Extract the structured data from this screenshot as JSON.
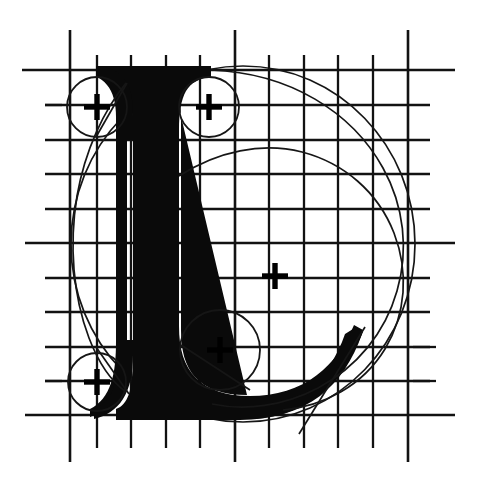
{
  "document": {
    "title": "Letterform Construction Diagram",
    "subject": "Capital letter L",
    "style": "Serif / Roman capital",
    "technique": "Geometric grid construction with circle guides",
    "background_color": "#ffffff",
    "ink_color": "#0a0a0a",
    "guide_color": "#161616",
    "width": 479,
    "height": 479
  },
  "canvas": {
    "width": 479,
    "height": 479
  },
  "grid": {
    "label": "construction-grid",
    "spacing": 34.5,
    "color": "#121212",
    "origin_x": 62,
    "origin_y": 70,
    "vertical_lines": [
      {
        "x": 70,
        "y1": 30,
        "y2": 462,
        "weight": "major"
      },
      {
        "x": 97,
        "y1": 55,
        "y2": 448,
        "weight": "minor"
      },
      {
        "x": 131,
        "y1": 55,
        "y2": 448,
        "weight": "minor"
      },
      {
        "x": 166,
        "y1": 55,
        "y2": 448,
        "weight": "minor"
      },
      {
        "x": 200,
        "y1": 55,
        "y2": 448,
        "weight": "minor"
      },
      {
        "x": 235,
        "y1": 30,
        "y2": 462,
        "weight": "major"
      },
      {
        "x": 269,
        "y1": 55,
        "y2": 448,
        "weight": "minor"
      },
      {
        "x": 304,
        "y1": 55,
        "y2": 448,
        "weight": "minor"
      },
      {
        "x": 338,
        "y1": 55,
        "y2": 448,
        "weight": "minor"
      },
      {
        "x": 373,
        "y1": 55,
        "y2": 448,
        "weight": "minor"
      },
      {
        "x": 408,
        "y1": 30,
        "y2": 462,
        "weight": "major"
      }
    ],
    "horizontal_lines": [
      {
        "y": 70,
        "x1": 22,
        "x2": 455,
        "weight": "major"
      },
      {
        "y": 105,
        "x1": 45,
        "x2": 430,
        "weight": "minor"
      },
      {
        "y": 140,
        "x1": 45,
        "x2": 430,
        "weight": "minor"
      },
      {
        "y": 174,
        "x1": 45,
        "x2": 430,
        "weight": "minor"
      },
      {
        "y": 209,
        "x1": 45,
        "x2": 430,
        "weight": "minor"
      },
      {
        "y": 243,
        "x1": 25,
        "x2": 455,
        "weight": "major"
      },
      {
        "y": 278,
        "x1": 45,
        "x2": 430,
        "weight": "minor"
      },
      {
        "y": 312,
        "x1": 45,
        "x2": 430,
        "weight": "minor"
      },
      {
        "y": 347,
        "x1": 45,
        "x2": 430,
        "weight": "minor"
      },
      {
        "y": 381,
        "x1": 45,
        "x2": 430,
        "weight": "minor"
      },
      {
        "y": 415,
        "x1": 25,
        "x2": 455,
        "weight": "major"
      }
    ],
    "edge_ticks": [
      {
        "x1": 45,
        "y1": 105,
        "x2": 62,
        "y2": 105
      },
      {
        "x1": 45,
        "y1": 381,
        "x2": 62,
        "y2": 381
      },
      {
        "x1": 413,
        "y1": 381,
        "x2": 436,
        "y2": 381
      },
      {
        "x1": 413,
        "y1": 347,
        "x2": 436,
        "y2": 347
      }
    ]
  },
  "glyph": {
    "letter": "L",
    "name": "capital-letter-l",
    "cap_height_top_y": 70,
    "baseline_y": 415,
    "stem_left_x": 128,
    "stem_right_x": 170,
    "serif_top_left_x": 96,
    "serif_top_right_x": 211,
    "bowl_right_x": 375,
    "description": "Serif capital L with rounded terminals, curved bowl sweeping right and a diagonal tail at the lower right"
  },
  "construction": {
    "small_circles": [
      {
        "name": "circle-top-left",
        "cx": 97,
        "cy": 107,
        "r": 30,
        "cross": true
      },
      {
        "name": "circle-top-right",
        "cx": 209,
        "cy": 107,
        "r": 30,
        "cross": true
      },
      {
        "name": "circle-bottom-left",
        "cx": 97,
        "cy": 382,
        "r": 29,
        "cross": true
      },
      {
        "name": "circle-lower-middle",
        "cx": 220,
        "cy": 350,
        "r": 40,
        "cross": true
      }
    ],
    "center_mark": {
      "name": "center-crosshair",
      "cx": 275,
      "cy": 276
    },
    "large_circle": {
      "name": "outer-construction-circle",
      "cx": 243,
      "cy": 244,
      "rx": 172,
      "ry": 178
    },
    "crosshair_arm": 13,
    "crosshair_thickness": 5.4
  },
  "legend": {
    "items": [
      {
        "key": "grid",
        "label": "Construction grid"
      },
      {
        "key": "small-circles",
        "label": "Terminal radius circles"
      },
      {
        "key": "large-circle",
        "label": "Outer proportion circle"
      },
      {
        "key": "crosshair",
        "label": "Circle centre mark"
      },
      {
        "key": "glyph",
        "label": "Letter outline"
      }
    ]
  }
}
